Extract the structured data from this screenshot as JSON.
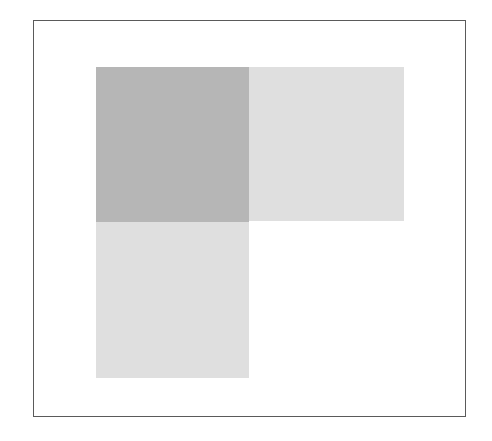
{
  "diagram": {
    "type": "grid-blocks",
    "frame": {
      "border_color": "#5a5a5a",
      "background": "#ffffff"
    },
    "cells": [
      {
        "id": "top-left",
        "row": 0,
        "col": 0,
        "shade": "dark",
        "color": "#b6b6b6"
      },
      {
        "id": "top-right",
        "row": 0,
        "col": 1,
        "shade": "light",
        "color": "#dfdfdf"
      },
      {
        "id": "bottom-left",
        "row": 1,
        "col": 0,
        "shade": "light",
        "color": "#dfdfdf"
      }
    ],
    "empty_cells": [
      {
        "id": "bottom-right",
        "row": 1,
        "col": 1
      }
    ]
  }
}
